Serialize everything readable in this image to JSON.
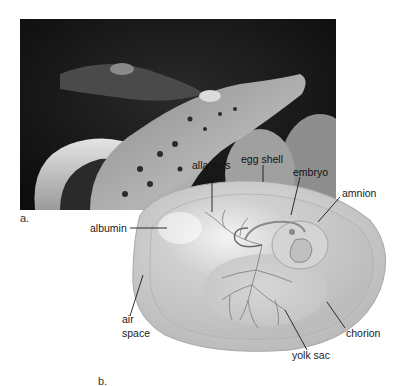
{
  "figure": {
    "panel_a_label": "a.",
    "panel_b_label": "b.",
    "photo_description": "hatching crocodile emerging from egg",
    "labels": {
      "albumin": "albumin",
      "allantois": "allantois",
      "egg_shell": "egg shell",
      "embryo": "embryo",
      "amnion": "amnion",
      "air_space_line1": "air",
      "air_space_line2": "space",
      "chorion": "chorion",
      "yolk_sac": "yolk sac"
    }
  }
}
